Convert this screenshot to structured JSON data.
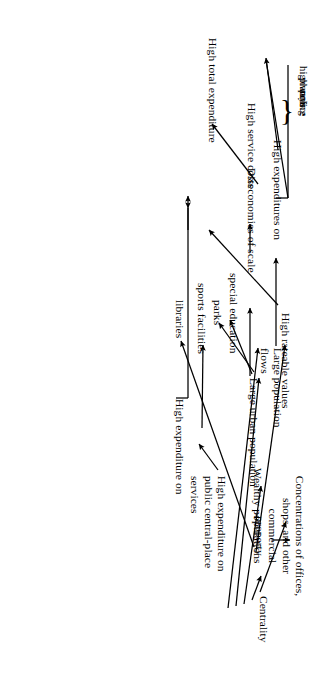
{
  "figure": {
    "kind": "causal-flow-diagram",
    "orientation": "rotated-90-ccw",
    "background_color": "#ffffff",
    "stroke_color": "#000000",
    "nodes": {
      "centrality": "Centrality",
      "concentrations": "Concentrations of offices,\nshops, and other commercial\nproperty",
      "wealthy_populations": "Wealthy populations",
      "high_rateable_values": "High rateable values",
      "high_total_expenditure": "High total expenditure",
      "high_expenditure_on": "High expenditure on",
      "libraries": "libraries",
      "sports_facilities": "sports facilities",
      "parks": "parks",
      "special_education": "special education",
      "public_central_place": "High expenditure on\npublic central-place\nservices",
      "large_urban_population": "Large urban population",
      "large_population_flows": "Large population\nflows",
      "diseconomies_of_scale": "Diseconomies of scale",
      "high_service_costs": "High service costs",
      "high_expenditures_on": "High expenditures on",
      "police": "police",
      "planning": "planning",
      "highways": "highways",
      "brace_glyph": "}"
    },
    "edges": [
      {
        "from": "centrality",
        "to": "concentrations"
      },
      {
        "from": "centrality",
        "to": "wealthy_populations"
      },
      {
        "from": "centrality",
        "to": "public_central_place"
      },
      {
        "from": "centrality",
        "to": "large_urban_population"
      },
      {
        "from": "centrality",
        "to": "large_population_flows"
      },
      {
        "from": "concentrations",
        "to": "high_rateable_values"
      },
      {
        "from": "wealthy_populations",
        "to": "high_rateable_values"
      },
      {
        "from": "wealthy_populations",
        "to": "libraries"
      },
      {
        "from": "high_rateable_values",
        "to": "high_total_expenditure"
      },
      {
        "from": "public_central_place",
        "to": "high_expenditure_on"
      },
      {
        "from": "high_expenditure_on",
        "to": "libraries"
      },
      {
        "from": "high_expenditure_on",
        "to": "sports_facilities"
      },
      {
        "from": "high_expenditure_on",
        "to": "high_total_expenditure"
      },
      {
        "from": "large_urban_population",
        "to": "parks"
      },
      {
        "from": "large_urban_population",
        "to": "special_education"
      },
      {
        "from": "large_urban_population",
        "to": "diseconomies_of_scale"
      },
      {
        "from": "diseconomies_of_scale",
        "to": "high_service_costs"
      },
      {
        "from": "high_service_costs",
        "to": "high_total_expenditure"
      },
      {
        "from": "large_population_flows",
        "to": "high_expenditures_on"
      },
      {
        "from": "high_expenditures_on",
        "to": "high_total_expenditure"
      }
    ]
  }
}
